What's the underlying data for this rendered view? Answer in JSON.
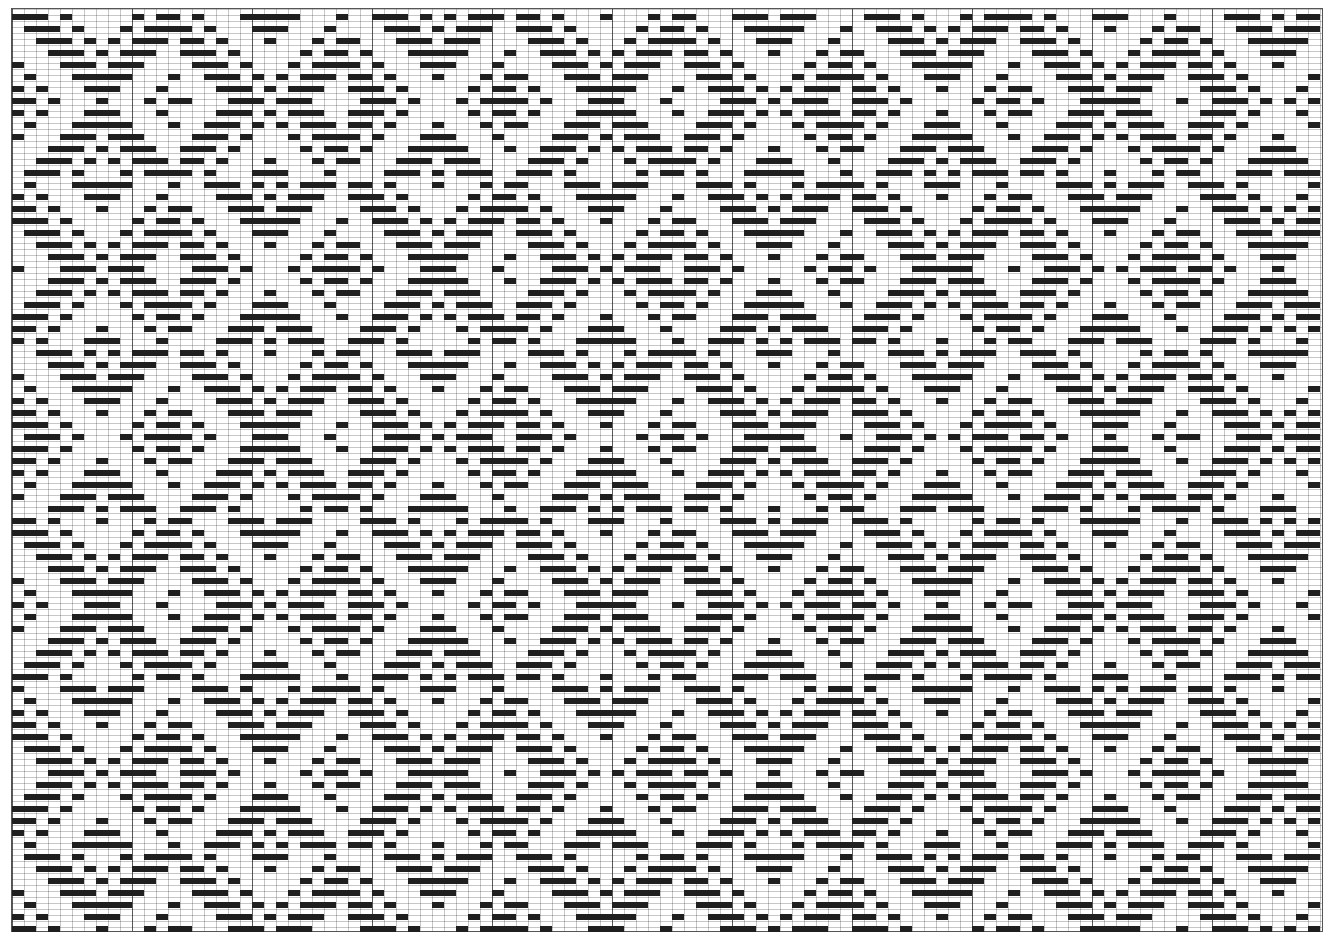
{
  "figure": {
    "type": "weave-drawdown",
    "columns": 109,
    "rows": 77,
    "cell_width": 12,
    "row_height": 12,
    "bar_height": 6,
    "bar_offset": 5,
    "major_grid_every": 10,
    "colors": {
      "filled": "#1f1f1f",
      "empty": "#ffffff",
      "grid": "#999999",
      "major_grid": "#444444"
    }
  },
  "draft": {
    "shafts": 8,
    "threading_sequence": [
      0,
      1,
      2,
      3,
      4,
      5,
      6,
      7,
      6,
      5,
      4,
      3,
      2,
      1
    ],
    "treadling_sequence": [
      0,
      1,
      2,
      3,
      4,
      5,
      6,
      7,
      6,
      5,
      4,
      3,
      2,
      1
    ],
    "threading_shift_per_repeat": 3,
    "treadling_shift_per_repeat": 5,
    "tieup_filled_offsets": [
      0,
      1,
      2,
      4
    ]
  }
}
